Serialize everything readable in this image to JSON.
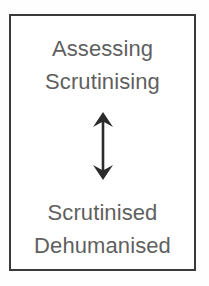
{
  "diagram": {
    "type": "concept-box-bidirectional",
    "border_color": "#3a3a3a",
    "background_color": "#ffffff",
    "text_color": "#5f5f5f",
    "arrow_color": "#2b2b2b",
    "top_labels": [
      {
        "text": "Assessing"
      },
      {
        "text": "Scrutinising"
      }
    ],
    "connector": {
      "icon": "double-headed-vertical-arrow",
      "direction": "bidirectional"
    },
    "bottom_labels": [
      {
        "text": "Scrutinised"
      },
      {
        "text": "Dehumanised"
      }
    ]
  }
}
